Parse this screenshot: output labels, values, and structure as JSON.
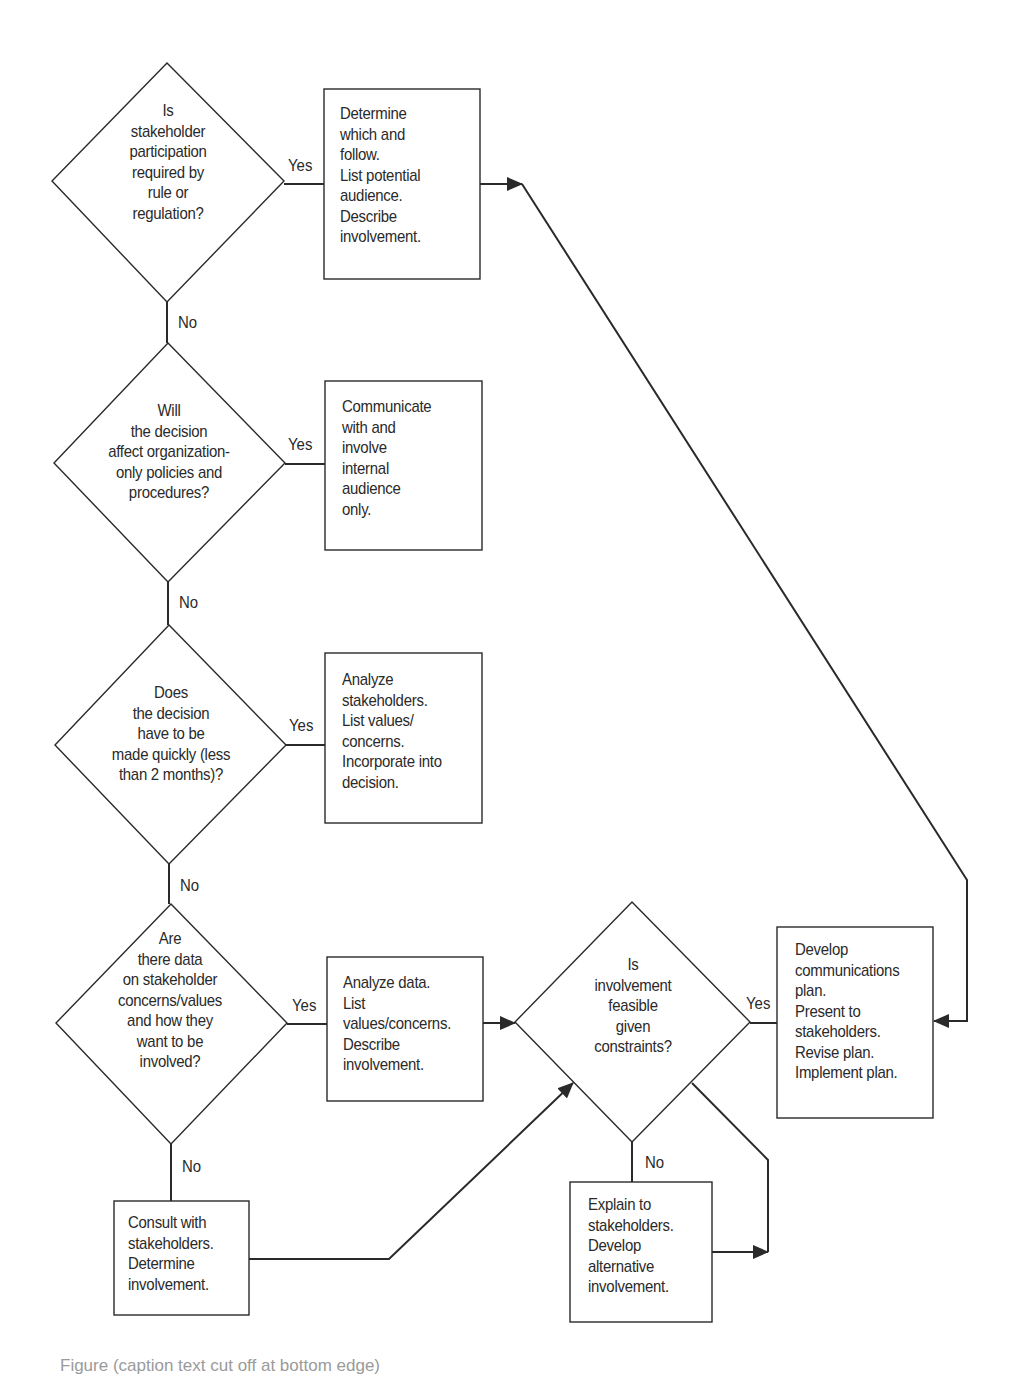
{
  "diagram": {
    "type": "flowchart",
    "line_color": "#2a2a2a",
    "background": "#ffffff",
    "decisions": [
      {
        "id": "d1",
        "text": "Is\nstakeholder\nparticipation\nrequired by\nrule or\nregulation?",
        "yes_label": "Yes",
        "no_label": "No"
      },
      {
        "id": "d2",
        "text": "Will\nthe decision\naffect organization-\nonly policies and\nprocedures?",
        "yes_label": "Yes",
        "no_label": "No"
      },
      {
        "id": "d3",
        "text": "Does\nthe decision\nhave to be\nmade quickly (less\nthan 2 months)?",
        "yes_label": "Yes",
        "no_label": "No"
      },
      {
        "id": "d4",
        "text": "Are\nthere data\non stakeholder\nconcerns/values\nand how they\nwant to be\ninvolved?",
        "yes_label": "Yes",
        "no_label": "No"
      },
      {
        "id": "d5",
        "text": "Is\ninvolvement\nfeasible\ngiven\nconstraints?",
        "yes_label": "Yes",
        "no_label": "No"
      }
    ],
    "processes": [
      {
        "id": "p1",
        "text": "Determine\nwhich and\nfollow.\nList potential\naudience.\nDescribe\ninvolvement."
      },
      {
        "id": "p2",
        "text": "Communicate\nwith and\ninvolve\ninternal\naudience\nonly."
      },
      {
        "id": "p3",
        "text": "Analyze\nstakeholders.\nList values/\nconcerns.\nIncorporate into\ndecision."
      },
      {
        "id": "p4",
        "text": "Analyze data.\nList\nvalues/concerns.\nDescribe\ninvolvement."
      },
      {
        "id": "p5",
        "text": "Consult with\nstakeholders.\nDetermine\ninvolvement."
      },
      {
        "id": "p6",
        "text": "Explain to\nstakeholders.\nDevelop\nalternative\ninvolvement."
      },
      {
        "id": "p7",
        "text": "Develop\ncommunications\nplan.\nPresent to\nstakeholders.\nRevise plan.\nImplement plan."
      }
    ],
    "edges": [
      {
        "from": "d1",
        "to": "p1",
        "label": "Yes"
      },
      {
        "from": "d1",
        "to": "d2",
        "label": "No"
      },
      {
        "from": "p1",
        "to": "p7",
        "label": ""
      },
      {
        "from": "d2",
        "to": "p2",
        "label": "Yes"
      },
      {
        "from": "d2",
        "to": "d3",
        "label": "No"
      },
      {
        "from": "d3",
        "to": "p3",
        "label": "Yes"
      },
      {
        "from": "d3",
        "to": "d4",
        "label": "No"
      },
      {
        "from": "d4",
        "to": "p4",
        "label": "Yes"
      },
      {
        "from": "d4",
        "to": "p5",
        "label": "No"
      },
      {
        "from": "p4",
        "to": "d5",
        "label": ""
      },
      {
        "from": "p5",
        "to": "d5",
        "label": ""
      },
      {
        "from": "d5",
        "to": "p7",
        "label": "Yes"
      },
      {
        "from": "d5",
        "to": "p6",
        "label": "No"
      },
      {
        "from": "p6",
        "to": "d5",
        "label": ""
      }
    ]
  },
  "caption": {
    "text": "Figure (caption text cut off at bottom edge)"
  }
}
